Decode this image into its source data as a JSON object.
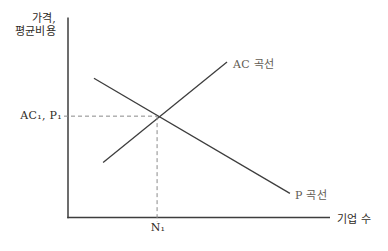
{
  "labels": {
    "y_axis_line1": "가격,",
    "y_axis_line2": "평균비용",
    "x_axis": "기업 수",
    "ac_curve": "AC 곡선",
    "p_curve": "P 곡선",
    "y_tick": "AC₁, P₁",
    "x_tick": "N₁"
  },
  "colors": {
    "line": "#3d3d3d",
    "dashed": "#8a8a8a",
    "text": "#2f2b26",
    "curve_label_text": "#615b52",
    "background": "#ffffff"
  },
  "chart_data": {
    "type": "line",
    "title": "",
    "xlabel": "기업 수",
    "ylabel": "가격, 평균비용",
    "xlim": [
      0,
      1
    ],
    "ylim": [
      0,
      1
    ],
    "grid": false,
    "legend": "labels placed at curve ends",
    "series": [
      {
        "name": "AC 곡선",
        "x": [
          0.134,
          0.607
        ],
        "y": [
          0.276,
          0.779
        ]
      },
      {
        "name": "P 곡선",
        "x": [
          0.099,
          0.847
        ],
        "y": [
          0.698,
          0.121
        ]
      }
    ],
    "annotations": {
      "equilibrium": {
        "x": 0.34,
        "y": 0.508,
        "x_tick_label": "N₁",
        "y_tick_label": "AC₁, P₁",
        "dashed_guides": true
      }
    }
  }
}
